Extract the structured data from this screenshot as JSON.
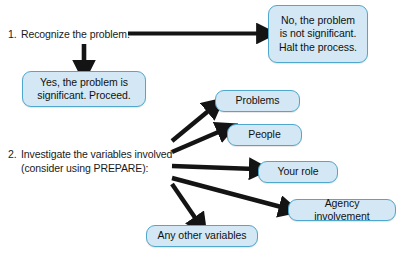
{
  "diagram": {
    "background_color": "#ffffff",
    "node_fill_color": "#d3e8f4",
    "node_border_color": "#4fa7cd",
    "arrow_color": "#141414",
    "text_color": "#111111"
  },
  "steps": [
    {
      "number": "1.",
      "line1": "Recognize the problem.",
      "line2": ""
    },
    {
      "number": "2.",
      "line1": "Investigate the variables involved",
      "line2": "(consider using PREPARE):"
    }
  ],
  "nodes": {
    "no_halt": {
      "text": "No, the problem\nis not significant.\nHalt the process."
    },
    "yes_proceed": {
      "text": "Yes, the problem is\nsignificant. Proceed."
    },
    "problems": {
      "text": "Problems"
    },
    "people": {
      "text": "People"
    },
    "your_role": {
      "text": "Your role"
    },
    "agency_involvement": {
      "text": "Agency involvement"
    },
    "any_other_variables": {
      "text": "Any other variables"
    }
  },
  "connectors": [
    {
      "name": "step1-to-no-halt",
      "from": "step-1-text",
      "to": "no_halt"
    },
    {
      "name": "step1-to-yes-proceed",
      "from": "step-1-text",
      "to": "yes_proceed"
    },
    {
      "name": "step2-to-problems",
      "from": "step-2-text",
      "to": "problems"
    },
    {
      "name": "step2-to-people",
      "from": "step-2-text",
      "to": "people"
    },
    {
      "name": "step2-to-your-role",
      "from": "step-2-text",
      "to": "your_role"
    },
    {
      "name": "step2-to-agency-involvement",
      "from": "step-2-text",
      "to": "agency_involvement"
    },
    {
      "name": "step2-to-any-other-variables",
      "from": "step-2-text",
      "to": "any_other_variables"
    }
  ]
}
